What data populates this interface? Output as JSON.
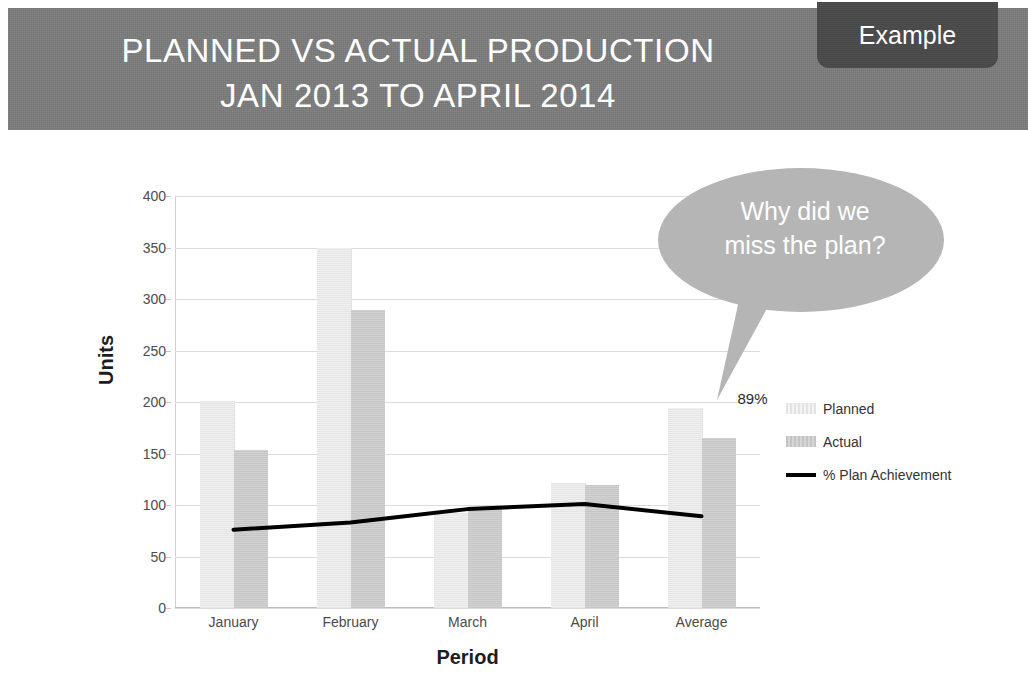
{
  "header": {
    "title": "PLANNED VS ACTUAL PRODUCTION\nJAN 2013 TO APRIL 2014",
    "badge_label": "Example",
    "banner_color": "#7b7b7b",
    "badge_color": "#4a4a4a"
  },
  "annotation": {
    "bubble_text": "Why did we\nmiss the plan?",
    "bubble_color": "#b5b5b5",
    "point_label": "89%"
  },
  "legend": {
    "position": "right",
    "items": [
      {
        "label": "Planned",
        "marker": "swatch",
        "color": "#ececec"
      },
      {
        "label": "Actual",
        "marker": "swatch",
        "color": "#cccccc"
      },
      {
        "label": "% Plan Achievement",
        "marker": "line",
        "color": "#000000"
      }
    ]
  },
  "chart_data": {
    "type": "bar",
    "title": "PLANNED VS ACTUAL PRODUCTION JAN 2013 TO APRIL 2014",
    "subtitle": "",
    "xlabel": "Period",
    "ylabel": "Units",
    "categories": [
      "January",
      "February",
      "March",
      "April",
      "Average"
    ],
    "ylim": [
      0,
      400
    ],
    "yticks": [
      0,
      50,
      100,
      150,
      200,
      250,
      300,
      350,
      400
    ],
    "grid": true,
    "series": [
      {
        "name": "Planned",
        "type": "bar",
        "color": "#e9e9e9",
        "values": [
          201,
          350,
          92,
          121,
          194
        ]
      },
      {
        "name": "Actual",
        "type": "bar",
        "color": "#c9c9c9",
        "values": [
          153,
          289,
          97,
          119,
          165
        ]
      },
      {
        "name": "% Plan Achievement",
        "type": "line",
        "color": "#000000",
        "values": [
          76,
          83,
          96,
          101,
          89
        ]
      }
    ],
    "annotations": [
      {
        "text": "89%",
        "category": "Average",
        "value": 89
      }
    ]
  }
}
